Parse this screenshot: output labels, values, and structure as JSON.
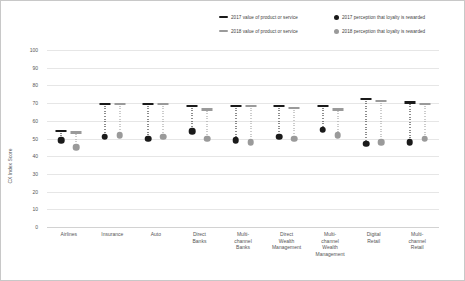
{
  "chart_data": {
    "type": "scatter",
    "title": "",
    "xlabel": "",
    "ylabel": "CX Index Score",
    "ylim": [
      0,
      100
    ],
    "ytick_step": 10,
    "yticks": [
      "100",
      "90",
      "80",
      "70",
      "60",
      "50",
      "40",
      "30",
      "20",
      "10",
      "0"
    ],
    "grid": true,
    "legend_position": "top-right",
    "categories": [
      "Airlines",
      "Insurance",
      "Auto",
      "Direct Banks",
      "Multi-channel Banks",
      "Direct Wealth Management",
      "Multi-channel Wealth Management",
      "Digital Retail",
      "Multi-channel Retail"
    ],
    "category_lines": [
      [
        "Airlines"
      ],
      [
        "Insurance"
      ],
      [
        "Auto"
      ],
      [
        "Direct",
        "Banks"
      ],
      [
        "Multi-",
        "channel",
        "Banks"
      ],
      [
        "Direct",
        "Wealth",
        "Management"
      ],
      [
        "Multi-",
        "channel",
        "Wealth",
        "Management"
      ],
      [
        "Digital",
        "Retail"
      ],
      [
        "Multi-",
        "channel",
        "Retail"
      ]
    ],
    "series": [
      {
        "name": "2017 value of product or service",
        "marker": "bar-cap",
        "color": "#1a1a1a",
        "values": [
          55,
          70,
          70,
          69,
          69,
          69,
          69,
          73,
          71
        ]
      },
      {
        "name": "2018 value of product or service",
        "marker": "bar-cap",
        "color": "#9a9a9a",
        "values": [
          54,
          70,
          70,
          67,
          69,
          68,
          67,
          72,
          70
        ]
      },
      {
        "name": "2017 perception that loyalty is rewarded",
        "marker": "dot",
        "color": "#1a1a1a",
        "values": [
          49,
          51,
          50,
          54,
          49,
          51,
          55,
          47,
          48
        ]
      },
      {
        "name": "2018 perception that loyalty is rewarded",
        "marker": "dot",
        "color": "#9a9a9a",
        "values": [
          45,
          52,
          51,
          50,
          48,
          50,
          52,
          48,
          50
        ]
      }
    ]
  },
  "legend": {
    "items": [
      "2017 value of product or service",
      "2017 perception that loyalty is rewarded",
      "2018 value of product or service",
      "2018 perception that loyalty is rewarded"
    ]
  },
  "colors": {
    "series_2017": "#1a1a1a",
    "series_2018": "#9a9a9a",
    "grid": "#e6e6e6",
    "text": "#555555",
    "background": "#ffffff"
  }
}
